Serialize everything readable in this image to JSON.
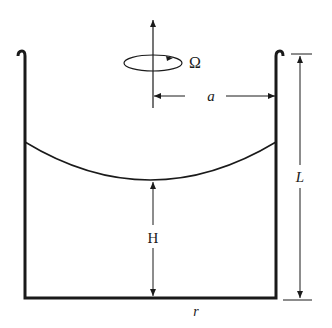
{
  "diagram": {
    "labels": {
      "omega": "Ω",
      "radius": "a",
      "height_center": "H",
      "container_height": "L",
      "radial_coord": "r"
    },
    "colors": {
      "stroke": "#1a1a1a",
      "background": "#ffffff"
    }
  }
}
